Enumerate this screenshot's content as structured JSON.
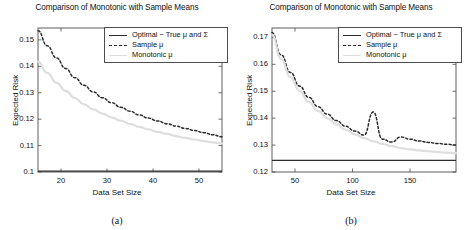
{
  "figure": {
    "panels": [
      {
        "id": "panel-a",
        "subcaption": "(a)",
        "title": "Comparison of Monotonic with Sample Means",
        "xlabel": "Data Set Size",
        "ylabel": "Expected Risk",
        "xticks": [
          "20",
          "30",
          "40",
          "50"
        ],
        "yticks": [
          "0.1",
          "0.11",
          "0.12",
          "0.13",
          "0.14",
          "0.15"
        ]
      },
      {
        "id": "panel-b",
        "subcaption": "(b)",
        "title": "Comparison of Monotonic with Sample Means",
        "xlabel": "Data Set Size",
        "ylabel": "Expected Risk",
        "xticks": [
          "50",
          "100",
          "150"
        ],
        "yticks": [
          "0.12",
          "0.13",
          "0.14",
          "0.15",
          "0.16",
          "0.17"
        ]
      }
    ],
    "legend": {
      "entries": [
        {
          "label": "Optimal − True μ and Σ",
          "style": "solid",
          "color": "#2b2b2b"
        },
        {
          "label": "Sample μ",
          "style": "dashed",
          "color": "#2b2b2b"
        },
        {
          "label": "Monotonic μ",
          "style": "solid-light",
          "color": "#dedede"
        }
      ]
    }
  },
  "chart_data": [
    {
      "type": "line",
      "panel": "(a)",
      "title": "Comparison of Monotonic with Sample Means",
      "xlabel": "Data Set Size",
      "ylabel": "Expected Risk",
      "xlim": [
        15,
        55
      ],
      "ylim": [
        0.1,
        0.1545
      ],
      "xticks": [
        20,
        30,
        40,
        50
      ],
      "yticks": [
        0.1,
        0.11,
        0.12,
        0.13,
        0.14,
        0.15
      ],
      "grid": false,
      "legend_position": "top-right",
      "series": [
        {
          "name": "Optimal − True μ and Σ",
          "style": "solid",
          "color": "#2b2b2b",
          "x": [
            15,
            55
          ],
          "values": [
            0.1003,
            0.1003
          ]
        },
        {
          "name": "Sample μ",
          "style": "dashed",
          "color": "#2b2b2b",
          "x": [
            15,
            17,
            19,
            21,
            23,
            25,
            27,
            29,
            31,
            33,
            35,
            37,
            39,
            41,
            43,
            45,
            47,
            49,
            51,
            53,
            55
          ],
          "values": [
            0.1535,
            0.1478,
            0.1432,
            0.1392,
            0.1357,
            0.1328,
            0.1303,
            0.1281,
            0.1262,
            0.1245,
            0.123,
            0.1216,
            0.1204,
            0.1193,
            0.1183,
            0.1174,
            0.1165,
            0.1157,
            0.1149,
            0.1141,
            0.1133
          ]
        },
        {
          "name": "Monotonic μ",
          "style": "solid-light",
          "color": "#dedede",
          "x": [
            15,
            17,
            19,
            21,
            23,
            25,
            27,
            29,
            31,
            33,
            35,
            37,
            39,
            41,
            43,
            45,
            47,
            49,
            51,
            53,
            55
          ],
          "values": [
            0.1418,
            0.1375,
            0.1338,
            0.1307,
            0.128,
            0.1256,
            0.1237,
            0.1221,
            0.1207,
            0.1194,
            0.1182,
            0.1171,
            0.1161,
            0.1152,
            0.1144,
            0.1136,
            0.1129,
            0.1123,
            0.1117,
            0.1112,
            0.1108
          ]
        }
      ]
    },
    {
      "type": "line",
      "panel": "(b)",
      "title": "Comparison of Monotonic with Sample Means",
      "xlabel": "Data Set Size",
      "ylabel": "Expected Risk",
      "xlim": [
        30,
        190
      ],
      "ylim": [
        0.12,
        0.1735
      ],
      "xticks": [
        50,
        100,
        150
      ],
      "yticks": [
        0.12,
        0.13,
        0.14,
        0.15,
        0.16,
        0.17
      ],
      "grid": false,
      "legend_position": "top-right",
      "series": [
        {
          "name": "Optimal − True μ and Σ",
          "style": "solid",
          "color": "#2b2b2b",
          "x": [
            30,
            190
          ],
          "values": [
            0.1243,
            0.1243
          ]
        },
        {
          "name": "Sample μ",
          "style": "dashed",
          "color": "#2b2b2b",
          "x": [
            30,
            38,
            46,
            54,
            62,
            70,
            78,
            86,
            94,
            102,
            110,
            118,
            126,
            134,
            142,
            150,
            158,
            166,
            174,
            182,
            190
          ],
          "values": [
            0.1718,
            0.1635,
            0.157,
            0.1519,
            0.1477,
            0.1443,
            0.1415,
            0.1391,
            0.137,
            0.1352,
            0.1337,
            0.1423,
            0.1322,
            0.1311,
            0.133,
            0.1322,
            0.1315,
            0.131,
            0.1306,
            0.1303,
            0.13
          ]
        },
        {
          "name": "Monotonic μ",
          "style": "solid-light",
          "color": "#dedede",
          "x": [
            30,
            38,
            46,
            54,
            62,
            70,
            78,
            86,
            94,
            102,
            110,
            118,
            126,
            134,
            142,
            150,
            158,
            166,
            174,
            182,
            190
          ],
          "values": [
            0.171,
            0.162,
            0.1553,
            0.1501,
            0.146,
            0.1427,
            0.14,
            0.1377,
            0.1357,
            0.134,
            0.1326,
            0.1314,
            0.1304,
            0.1296,
            0.1289,
            0.1284,
            0.128,
            0.1277,
            0.1274,
            0.1272,
            0.127
          ]
        }
      ]
    }
  ]
}
